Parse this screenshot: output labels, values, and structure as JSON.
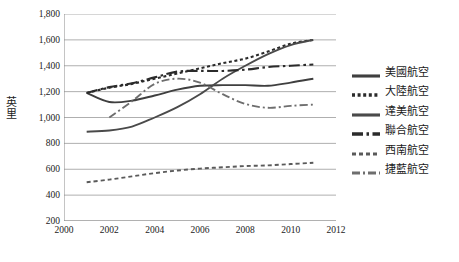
{
  "chart_data": {
    "type": "line",
    "title": "",
    "xlabel": "",
    "ylabel": "英里",
    "xlim": [
      2000,
      2012
    ],
    "ylim": [
      200,
      1800
    ],
    "xticks": [
      "2000",
      "2002",
      "2004",
      "2006",
      "2008",
      "2010",
      "2012"
    ],
    "yticks": [
      "1,800",
      "1,600",
      "1,400",
      "1,200",
      "1,000",
      "800",
      "600",
      "400",
      "200"
    ],
    "grid": "horizontal",
    "legend_position": "right",
    "series": [
      {
        "name": "美國航空",
        "style": "solid",
        "color": "#3f3f3f",
        "x": [
          2001,
          2002,
          2003,
          2004,
          2005,
          2006,
          2007,
          2008,
          2009,
          2010,
          2011
        ],
        "values": [
          1190,
          1120,
          1130,
          1170,
          1215,
          1245,
          1250,
          1250,
          1245,
          1270,
          1300
        ]
      },
      {
        "name": "大陸航空",
        "style": "dotted",
        "color": "#2b2b2b",
        "x": [
          2001,
          2002,
          2003,
          2004,
          2005,
          2006,
          2007,
          2008,
          2009,
          2010,
          2011
        ],
        "values": [
          1190,
          1230,
          1260,
          1300,
          1340,
          1380,
          1420,
          1455,
          1510,
          1570,
          1600
        ]
      },
      {
        "name": "達美航空",
        "style": "solid",
        "color": "#4a4a4a",
        "x": [
          2001,
          2002,
          2003,
          2004,
          2005,
          2006,
          2007,
          2008,
          2009,
          2010,
          2011
        ],
        "values": [
          890,
          900,
          930,
          1000,
          1080,
          1180,
          1300,
          1400,
          1490,
          1560,
          1600
        ]
      },
      {
        "name": "聯合航空",
        "style": "dashdot-long",
        "color": "#2b2b2b",
        "x": [
          2001,
          2002,
          2003,
          2004,
          2005,
          2006,
          2007,
          2008,
          2009,
          2010,
          2011
        ],
        "values": [
          1190,
          1235,
          1265,
          1310,
          1355,
          1360,
          1360,
          1370,
          1390,
          1400,
          1410
        ]
      },
      {
        "name": "西南航空",
        "style": "dashed-small",
        "color": "#5a5a5a",
        "x": [
          2001,
          2002,
          2003,
          2004,
          2005,
          2006,
          2007,
          2008,
          2009,
          2010,
          2011
        ],
        "values": [
          500,
          520,
          545,
          570,
          590,
          605,
          615,
          625,
          630,
          640,
          650
        ]
      },
      {
        "name": "捷藍航空",
        "style": "dashdot",
        "color": "#6e6e6e",
        "x": [
          2002,
          2003,
          2004,
          2005,
          2006,
          2007,
          2008,
          2009,
          2010,
          2011
        ],
        "values": [
          1000,
          1125,
          1260,
          1300,
          1270,
          1180,
          1105,
          1075,
          1090,
          1100
        ]
      }
    ]
  }
}
